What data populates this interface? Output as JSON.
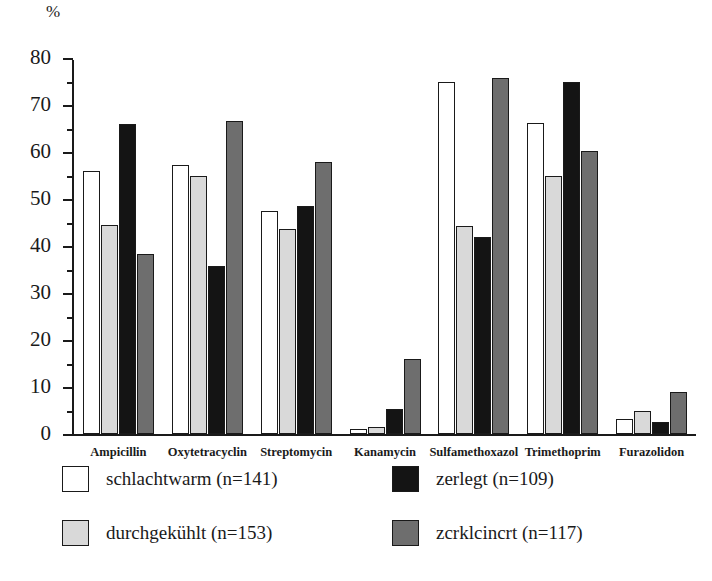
{
  "chart_data": {
    "type": "bar",
    "title": "",
    "xlabel": "",
    "ylabel": "%",
    "ylim": [
      0,
      80
    ],
    "yticks": [
      0,
      10,
      20,
      30,
      40,
      50,
      60,
      70,
      80
    ],
    "ytick_labels": [
      "0",
      "10",
      "20",
      "30",
      "40",
      "50",
      "60",
      "70",
      "80"
    ],
    "minor_tick_step": 5,
    "grid": false,
    "legend_position": "bottom",
    "categories": [
      "Ampicillin",
      "Oxytetracyclin",
      "Streptomycin",
      "Kanamycin",
      "Sulfamethoxazol",
      "Trimethoprim",
      "Furazolidon"
    ],
    "series": [
      {
        "name": "schlachtwarm (n=141)",
        "color": "#ffffff",
        "values": [
          56.0,
          57.3,
          47.4,
          1.0,
          74.8,
          66.2,
          3.2
        ]
      },
      {
        "name": "durchgekühlt (n=153)",
        "color": "#d9d9d9",
        "values": [
          44.4,
          54.9,
          43.6,
          1.4,
          44.3,
          54.9,
          5.0
        ]
      },
      {
        "name": "zerlegt (n=109)",
        "color": "#141414",
        "values": [
          66.0,
          35.7,
          48.5,
          5.4,
          41.9,
          74.8,
          2.5
        ]
      },
      {
        "name": "zcrklcincrt (n=117)",
        "color": "#6e6e6e",
        "values": [
          38.4,
          66.6,
          57.9,
          16.0,
          75.8,
          60.3,
          9.0
        ]
      }
    ]
  },
  "legend": {
    "items": [
      {
        "label": "schlachtwarm (n=141)",
        "swatch": "#ffffff"
      },
      {
        "label": "zerlegt (n=109)",
        "swatch": "#141414"
      },
      {
        "label": "durchgekühlt (n=153)",
        "swatch": "#d9d9d9"
      },
      {
        "label": "zcrklcincrt (n=117)",
        "swatch": "#6e6e6e"
      }
    ]
  }
}
